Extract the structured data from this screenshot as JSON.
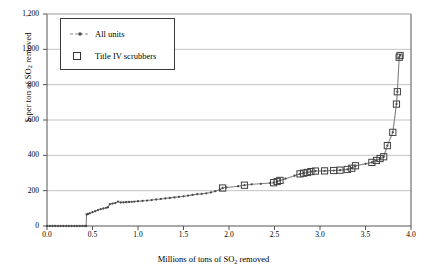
{
  "chart_data": {
    "type": "line",
    "title": "",
    "xlabel": "Millions of tons of SO2 removed",
    "ylabel": "$ per ton of SO2 removed",
    "xlim": [
      0.0,
      4.0
    ],
    "ylim": [
      0,
      1200
    ],
    "xticks": [
      "0.0",
      "0.5",
      "1.0",
      "1.5",
      "2.0",
      "2.5",
      "3.0",
      "3.5",
      "4.0"
    ],
    "yticks": [
      "0",
      "200",
      "400",
      "600",
      "800",
      "1,000",
      "1,200"
    ],
    "xtick_values": [
      0.0,
      0.5,
      1.0,
      1.5,
      2.0,
      2.5,
      3.0,
      3.5,
      4.0
    ],
    "ytick_values": [
      0,
      200,
      400,
      600,
      800,
      1000,
      1200
    ],
    "grid": "horizontal",
    "legend_position": "upper-left-inset",
    "series": [
      {
        "name": "All units",
        "marker": "small-dot",
        "line": "dashed-gray",
        "points": [
          [
            0.0,
            0
          ],
          [
            0.03,
            0
          ],
          [
            0.06,
            0
          ],
          [
            0.09,
            0
          ],
          [
            0.12,
            0
          ],
          [
            0.15,
            0
          ],
          [
            0.18,
            0
          ],
          [
            0.21,
            0
          ],
          [
            0.24,
            0
          ],
          [
            0.27,
            0
          ],
          [
            0.3,
            0
          ],
          [
            0.33,
            0
          ],
          [
            0.36,
            0
          ],
          [
            0.39,
            0
          ],
          [
            0.42,
            0
          ],
          [
            0.43,
            0
          ],
          [
            0.435,
            65
          ],
          [
            0.45,
            68
          ],
          [
            0.47,
            72
          ],
          [
            0.5,
            78
          ],
          [
            0.53,
            84
          ],
          [
            0.56,
            90
          ],
          [
            0.59,
            95
          ],
          [
            0.62,
            99
          ],
          [
            0.65,
            103
          ],
          [
            0.67,
            106
          ],
          [
            0.69,
            124
          ],
          [
            0.72,
            127
          ],
          [
            0.75,
            130
          ],
          [
            0.78,
            138
          ],
          [
            0.81,
            133
          ],
          [
            0.84,
            134
          ],
          [
            0.87,
            135
          ],
          [
            0.9,
            136
          ],
          [
            0.93,
            137
          ],
          [
            0.96,
            138
          ],
          [
            1.0,
            140
          ],
          [
            1.05,
            142
          ],
          [
            1.1,
            144
          ],
          [
            1.15,
            147
          ],
          [
            1.2,
            150
          ],
          [
            1.25,
            153
          ],
          [
            1.3,
            156
          ],
          [
            1.35,
            159
          ],
          [
            1.4,
            162
          ],
          [
            1.45,
            165
          ],
          [
            1.5,
            168
          ],
          [
            1.55,
            172
          ],
          [
            1.6,
            176
          ],
          [
            1.65,
            180
          ],
          [
            1.7,
            182
          ],
          [
            1.75,
            185
          ],
          [
            1.8,
            190
          ],
          [
            1.85,
            197
          ],
          [
            1.9,
            206
          ],
          [
            1.93,
            215
          ],
          [
            1.97,
            218
          ],
          [
            2.1,
            225
          ],
          [
            2.17,
            231
          ],
          [
            2.25,
            236
          ],
          [
            2.35,
            239
          ],
          [
            2.45,
            243
          ],
          [
            2.49,
            245
          ],
          [
            2.53,
            252
          ],
          [
            2.56,
            258
          ],
          [
            2.62,
            268
          ],
          [
            2.72,
            285
          ],
          [
            2.78,
            295
          ],
          [
            2.82,
            299
          ],
          [
            2.86,
            303
          ],
          [
            2.9,
            308
          ],
          [
            2.95,
            311
          ],
          [
            3.05,
            312
          ],
          [
            3.15,
            314
          ],
          [
            3.22,
            316
          ],
          [
            3.3,
            320
          ],
          [
            3.35,
            327
          ],
          [
            3.39,
            341
          ],
          [
            3.5,
            352
          ],
          [
            3.57,
            360
          ],
          [
            3.62,
            371
          ],
          [
            3.66,
            382
          ],
          [
            3.7,
            392
          ],
          [
            3.74,
            455
          ],
          [
            3.8,
            530
          ],
          [
            3.84,
            690
          ],
          [
            3.85,
            760
          ],
          [
            3.87,
            955
          ],
          [
            3.88,
            965
          ]
        ]
      },
      {
        "name": "Title IV scrubbers",
        "marker": "open-square",
        "points": [
          [
            1.93,
            215
          ],
          [
            2.17,
            231
          ],
          [
            2.49,
            245
          ],
          [
            2.53,
            252
          ],
          [
            2.56,
            258
          ],
          [
            2.78,
            295
          ],
          [
            2.82,
            299
          ],
          [
            2.86,
            303
          ],
          [
            2.9,
            308
          ],
          [
            2.95,
            311
          ],
          [
            3.05,
            312
          ],
          [
            3.15,
            314
          ],
          [
            3.22,
            316
          ],
          [
            3.3,
            320
          ],
          [
            3.35,
            327
          ],
          [
            3.39,
            341
          ],
          [
            3.57,
            360
          ],
          [
            3.62,
            371
          ],
          [
            3.66,
            382
          ],
          [
            3.7,
            392
          ],
          [
            3.74,
            455
          ],
          [
            3.8,
            530
          ],
          [
            3.84,
            690
          ],
          [
            3.85,
            760
          ],
          [
            3.87,
            955
          ],
          [
            3.88,
            965
          ]
        ]
      }
    ]
  },
  "legend": {
    "items": [
      {
        "label": "All units"
      },
      {
        "label": "Title IV scrubbers"
      }
    ]
  },
  "axes": {
    "y_label_prefix": "$ per ton of SO",
    "y_label_sub": "2",
    "y_label_suffix": " removed",
    "x_label_prefix": "Millions of tons of SO",
    "x_label_sub": "2",
    "x_label_suffix": " removed"
  },
  "colors": {
    "line": "#808080",
    "marker_edge": "#404040",
    "grid": "#a9a9a9",
    "axis": "#555555",
    "text": "#000000"
  }
}
